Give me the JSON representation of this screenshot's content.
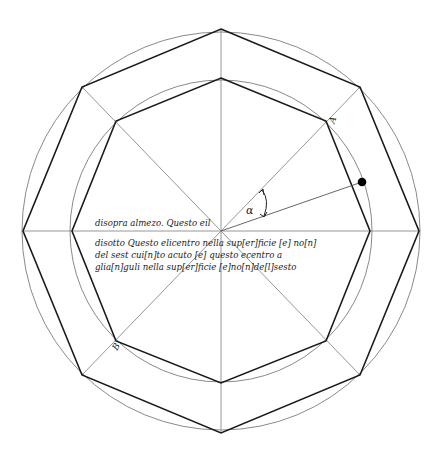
{
  "diagram": {
    "center": [
      221,
      231
    ],
    "outer_circle_radius": 199,
    "inner_circle_radius": 151,
    "colors": {
      "thin_line": "#8a8a8a",
      "thick_line": "#1a1a1a",
      "dot": "#000000"
    },
    "labels": {
      "vertex_a": "A",
      "vertex_b": "B",
      "angle": "α"
    },
    "text": {
      "above_line": "disopra almezo. Questo eil",
      "below_lines": [
        "disotto Questo elicentro nella sup[er]ficie [e] no[n]",
        "del sest cui[n]to acuto [e] questo ecentro a",
        "glia[n]guli nella sup[er]ficie [e]no[n]de[l]sesto"
      ]
    }
  }
}
